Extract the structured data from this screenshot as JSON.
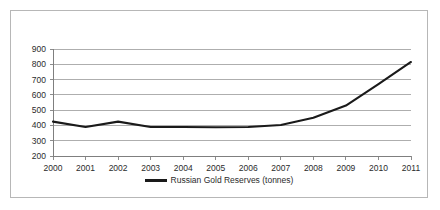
{
  "chart_data": {
    "type": "line",
    "title": "",
    "xlabel": "",
    "ylabel": "",
    "categories": [
      "2000",
      "2001",
      "2002",
      "2003",
      "2004",
      "2005",
      "2006",
      "2007",
      "2008",
      "2009",
      "2010",
      "2011"
    ],
    "series": [
      {
        "name": "Russian Gold Reserves (tonnes)",
        "values": [
          425,
          390,
          425,
          390,
          390,
          388,
          390,
          403,
          450,
          530,
          670,
          815
        ]
      }
    ],
    "ylim": [
      200,
      900
    ],
    "yticks": [
      200,
      300,
      400,
      500,
      600,
      700,
      800,
      900
    ],
    "ytick_labels": [
      "200",
      "300",
      "400",
      "500",
      "600",
      "700",
      "800",
      "900"
    ],
    "xticks": [
      "2000",
      "2001",
      "2002",
      "2003",
      "2004",
      "2005",
      "2006",
      "2007",
      "2008",
      "2009",
      "2010",
      "2011"
    ],
    "grid": "horizontal",
    "legend_position": "bottom-center",
    "line_color": "#1a1a1a",
    "gridline_color": "#9a9a9a",
    "axis_color": "#7f7f7f",
    "border_color": "#b7b7b7",
    "background_color": "#ffffff"
  },
  "legend": {
    "entries": [
      {
        "label": "Russian Gold Reserves (tonnes)",
        "color": "#1a1a1a"
      }
    ]
  }
}
